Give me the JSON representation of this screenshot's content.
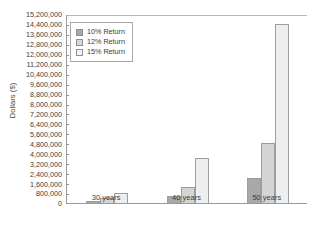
{
  "chart_data": {
    "type": "bar",
    "title": "",
    "xlabel": "",
    "ylabel": "Dollars ($)",
    "categories": [
      "30 years",
      "40 years",
      "50 years"
    ],
    "series": [
      {
        "name": "10% Return",
        "values": [
          200000,
          600000,
          2000000
        ],
        "color": "#a8a8a8"
      },
      {
        "name": "12% Return",
        "values": [
          400000,
          1300000,
          4800000
        ],
        "color": "#d4d4d4"
      },
      {
        "name": "15% Return",
        "values": [
          800000,
          3600000,
          14400000
        ],
        "color": "#eeeeee"
      }
    ],
    "ylim": [
      0,
      15200000
    ],
    "ytick_step": 800000,
    "yticks": [
      "15,200,000",
      "14,400,000",
      "13,600,000",
      "12,800,000",
      "12,000,000",
      "11,200,000",
      "10,400,000",
      "9,600,000",
      "8,800,000",
      "8,000,000",
      "7,200,000",
      "6,400,000",
      "5,600,000",
      "4,800,000",
      "4,000,000",
      "3,200,000",
      "2,400,000",
      "1,600,000",
      "800,000",
      "0"
    ],
    "grid": false,
    "legend_position": "top-left"
  },
  "legend": {
    "items": [
      {
        "label": "10% Return"
      },
      {
        "label": "12% Return"
      },
      {
        "label": "15% Return"
      }
    ]
  },
  "axis": {
    "y_title": "Dollars ($)"
  }
}
